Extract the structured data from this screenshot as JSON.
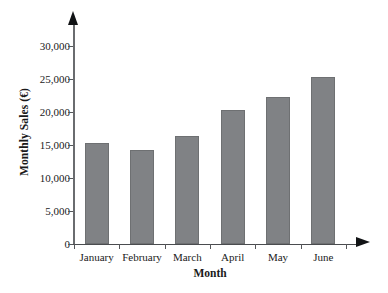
{
  "chart_data": {
    "type": "bar",
    "title": "",
    "categories": [
      "January",
      "February",
      "March",
      "April",
      "May",
      "June"
    ],
    "values": [
      15000,
      14000,
      16000,
      20000,
      22000,
      25000
    ],
    "series": [
      {
        "name": "Monthly Sales",
        "values": [
          15000,
          14000,
          16000,
          20000,
          22000,
          25000
        ]
      }
    ],
    "xlabel": "Month",
    "ylabel": "Monthly Sales (€)",
    "ylim": [
      0,
      30000
    ],
    "yticks": [
      0,
      5000,
      10000,
      15000,
      20000,
      25000,
      30000
    ],
    "ytick_labels": [
      "0",
      "5,000",
      "10,000",
      "15,000",
      "20,000",
      "25,000",
      "30,000"
    ],
    "grid": false,
    "legend": false,
    "bar_color": "#808285",
    "axis_color": "#4a4c4f",
    "axis_arrows": true,
    "xtick_position": "between-categories"
  }
}
